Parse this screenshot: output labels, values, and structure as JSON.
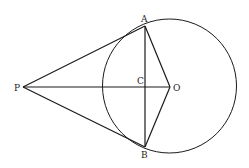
{
  "diagram": {
    "points": {
      "P": {
        "label": "P",
        "x": 23,
        "y": 87
      },
      "A": {
        "label": "A",
        "x": 145,
        "y": 26
      },
      "B": {
        "label": "B",
        "x": 145,
        "y": 147
      },
      "O": {
        "label": "O",
        "x": 170,
        "y": 87
      },
      "C": {
        "label": "C",
        "x": 145,
        "y": 87
      }
    },
    "circle": {
      "center": "O",
      "cx": 169.5,
      "cy": 86,
      "r": 67
    },
    "segments": [
      "PA",
      "PB",
      "PO",
      "AB",
      "OA",
      "OB"
    ],
    "stroke_color": "#1a1a1a"
  }
}
